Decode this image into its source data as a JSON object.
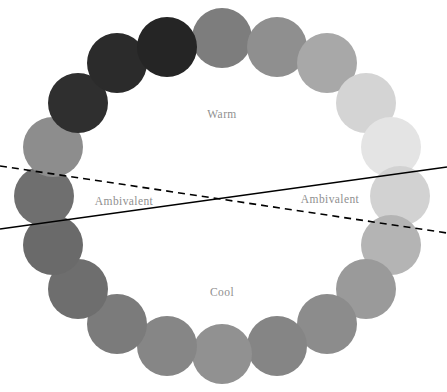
{
  "figure": {
    "name": "affect-circumplex-color-wheel",
    "background_color": "#ffffff",
    "width": 447,
    "height": 392
  },
  "labels": {
    "warm": "Warm",
    "cool": "Cool",
    "ambivalent_left": "Ambivalent",
    "ambivalent_right": "Ambivalent",
    "text_color": "#8f8f8f"
  },
  "dividers": {
    "dashed": {
      "style": "dashed",
      "color": "#000000",
      "x1": 0,
      "y1": 166,
      "x2": 447,
      "y2": 233
    },
    "solid": {
      "style": "solid",
      "color": "#000000",
      "x1": 0,
      "y1": 229,
      "x2": 447,
      "y2": 167
    },
    "intersection": {
      "x": 222,
      "y": 199
    }
  },
  "chart_data": {
    "type": "scatter",
    "title": "",
    "xlabel": "",
    "ylabel": "",
    "grid": false,
    "legend": null,
    "layout": {
      "shape": "ring",
      "center_x": 222,
      "center_y": 196,
      "radius_x": 178,
      "radius_y": 158,
      "point_count": 20,
      "point_radius": 30,
      "start_angle_deg": -90,
      "direction": "clockwise"
    },
    "annotations": [
      {
        "text": "Warm",
        "x": 222,
        "y": 114
      },
      {
        "text": "Cool",
        "x": 222,
        "y": 292
      },
      {
        "text": "Ambivalent",
        "x": 124,
        "y": 201
      },
      {
        "text": "Ambivalent",
        "x": 330,
        "y": 199
      }
    ],
    "categories": [
      "node-01",
      "node-02",
      "node-03",
      "node-04",
      "node-05",
      "node-06",
      "node-07",
      "node-08",
      "node-09",
      "node-10",
      "node-11",
      "node-12",
      "node-13",
      "node-14",
      "node-15",
      "node-16",
      "node-17",
      "node-18",
      "node-19",
      "node-20"
    ],
    "series": [
      {
        "name": "ring-nodes",
        "points": [
          {
            "index": 0,
            "angle_deg": -90,
            "cx": 222,
            "cy": 38,
            "color": "#7d7d7d",
            "gray_value": 125
          },
          {
            "index": 1,
            "angle_deg": -72,
            "cx": 277,
            "cy": 47,
            "color": "#8f8f8f",
            "gray_value": 143
          },
          {
            "index": 2,
            "angle_deg": -54,
            "cx": 327,
            "cy": 63,
            "color": "#a8a8a8",
            "gray_value": 168
          },
          {
            "index": 3,
            "angle_deg": -36,
            "cx": 366,
            "cy": 103,
            "color": "#d4d4d4",
            "gray_value": 212
          },
          {
            "index": 4,
            "angle_deg": -18,
            "cx": 391,
            "cy": 147,
            "color": "#e4e4e4",
            "gray_value": 228
          },
          {
            "index": 5,
            "angle_deg": 0,
            "cx": 400,
            "cy": 196,
            "color": "#d2d2d2",
            "gray_value": 210
          },
          {
            "index": 6,
            "angle_deg": 18,
            "cx": 391,
            "cy": 245,
            "color": "#b4b4b4",
            "gray_value": 180
          },
          {
            "index": 7,
            "angle_deg": 36,
            "cx": 366,
            "cy": 289,
            "color": "#9a9a9a",
            "gray_value": 154
          },
          {
            "index": 8,
            "angle_deg": 54,
            "cx": 327,
            "cy": 324,
            "color": "#8c8c8c",
            "gray_value": 140
          },
          {
            "index": 9,
            "angle_deg": 72,
            "cx": 277,
            "cy": 346,
            "color": "#858585",
            "gray_value": 133
          },
          {
            "index": 10,
            "angle_deg": 90,
            "cx": 222,
            "cy": 354,
            "color": "#919191",
            "gray_value": 145
          },
          {
            "index": 11,
            "angle_deg": 108,
            "cx": 167,
            "cy": 346,
            "color": "#868686",
            "gray_value": 134
          },
          {
            "index": 12,
            "angle_deg": 126,
            "cx": 117,
            "cy": 324,
            "color": "#7b7b7b",
            "gray_value": 123
          },
          {
            "index": 13,
            "angle_deg": 144,
            "cx": 78,
            "cy": 289,
            "color": "#6e6e6e",
            "gray_value": 110
          },
          {
            "index": 14,
            "angle_deg": 162,
            "cx": 53,
            "cy": 245,
            "color": "#6a6a6a",
            "gray_value": 106
          },
          {
            "index": 15,
            "angle_deg": 180,
            "cx": 44,
            "cy": 196,
            "color": "#6f6f6f",
            "gray_value": 111
          },
          {
            "index": 16,
            "angle_deg": 198,
            "cx": 53,
            "cy": 147,
            "color": "#8d8d8d",
            "gray_value": 141
          },
          {
            "index": 17,
            "angle_deg": 216,
            "cx": 78,
            "cy": 103,
            "color": "#2f2f2f",
            "gray_value": 47
          },
          {
            "index": 18,
            "angle_deg": 234,
            "cx": 117,
            "cy": 63,
            "color": "#2b2b2b",
            "gray_value": 43
          },
          {
            "index": 19,
            "angle_deg": 252,
            "cx": 167,
            "cy": 47,
            "color": "#252525",
            "gray_value": 37
          }
        ]
      }
    ]
  }
}
